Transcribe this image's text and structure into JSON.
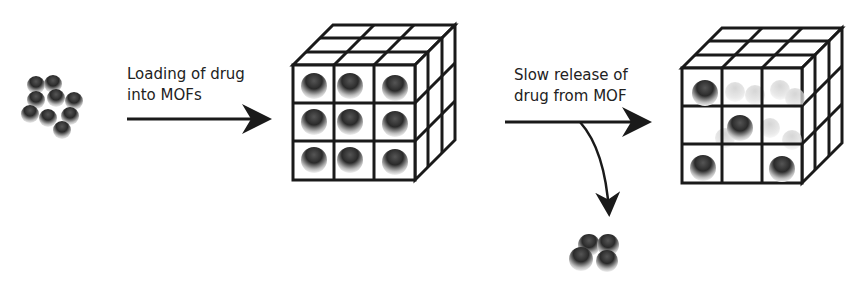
{
  "diagram": {
    "step1": {
      "line1": "Loading of drug",
      "line2": "into MOFs"
    },
    "step2": {
      "line1": "Slow release of",
      "line2": "drug from MOF"
    },
    "nodes": [
      {
        "id": "free-drug-cluster",
        "desc": "Cluster of drug molecules (spheres)"
      },
      {
        "id": "loaded-mof",
        "desc": "3x3x3 MOF cube fully loaded with drug spheres"
      },
      {
        "id": "released-drug-cluster",
        "desc": "Released drug spheres"
      },
      {
        "id": "partially-emptied-mof",
        "desc": "MOF cube with some drug spheres remaining"
      }
    ],
    "edges": [
      {
        "from": "free-drug-cluster",
        "to": "loaded-mof",
        "label": "Loading of drug into MOFs"
      },
      {
        "from": "loaded-mof",
        "to": "partially-emptied-mof",
        "label": "Slow release of drug from MOF"
      },
      {
        "from": "loaded-mof",
        "to": "released-drug-cluster",
        "label": ""
      }
    ],
    "colors": {
      "line": "#1a1a1a",
      "sphere_dark": "#2a2a2a",
      "sphere_light": "#e8e8e8",
      "ghost": "#c8c8c8"
    }
  }
}
